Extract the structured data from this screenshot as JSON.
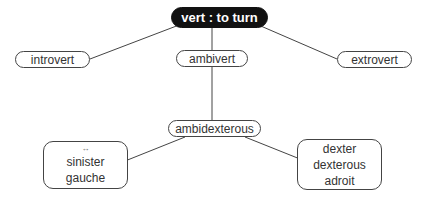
{
  "diagram": {
    "root": {
      "label": "vert : to turn"
    },
    "nodes": {
      "introvert": {
        "label": "introvert"
      },
      "extrovert": {
        "label": "extrovert"
      },
      "ambivert": {
        "label": "ambivert"
      },
      "ambidexterous": {
        "label": "ambidexterous"
      },
      "left_box": {
        "arrow": "↔",
        "lines": [
          "sinister",
          "gauche"
        ]
      },
      "right_box": {
        "lines": [
          "dexter",
          "dexterous",
          "adroit"
        ]
      }
    },
    "colors": {
      "root_bg": "#111111",
      "root_text": "#ffffff",
      "line": "#444444",
      "text": "#333333"
    }
  }
}
